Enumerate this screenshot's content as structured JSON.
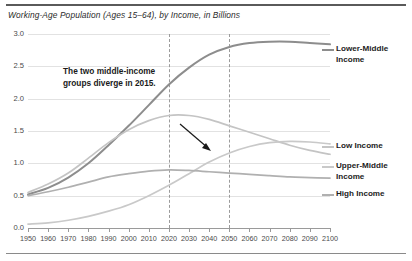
{
  "chart_data": {
    "type": "line",
    "title": "Working-Age Population (Ages 15–64), by Income, in Billions",
    "xlabel": "",
    "ylabel": "",
    "xlim": [
      1950,
      2100
    ],
    "ylim": [
      0.0,
      3.0
    ],
    "grid": true,
    "legend_position": "right",
    "yticks": [
      "0.0",
      "0.5",
      "1.0",
      "1.5",
      "2.0",
      "2.5",
      "3.0"
    ],
    "ytick_values": [
      0.0,
      0.5,
      1.0,
      1.5,
      2.0,
      2.5,
      3.0
    ],
    "xticks": [
      "1950",
      "1960",
      "1970",
      "1980",
      "1990",
      "2000",
      "2010",
      "2020",
      "2030",
      "2040",
      "2050",
      "2060",
      "2070",
      "2080",
      "2090",
      "2100"
    ],
    "xtick_values": [
      1950,
      1960,
      1970,
      1980,
      1990,
      2000,
      2010,
      2020,
      2030,
      2040,
      2050,
      2060,
      2070,
      2080,
      2090,
      2100
    ],
    "reference_lines": [
      {
        "name": "dashed-2020",
        "x": 2020,
        "style": "dashed"
      },
      {
        "name": "dashed-2050",
        "x": 2050,
        "style": "dashed"
      }
    ],
    "annotations": [
      {
        "name": "divergence-note",
        "text_line1": "The two middle-income",
        "text_line2": "groups diverge in 2015.",
        "points_to_year": 2015,
        "points_to_value": 1.62
      }
    ],
    "x": [
      1950,
      1960,
      1970,
      1980,
      1990,
      2000,
      2010,
      2020,
      2030,
      2040,
      2050,
      2060,
      2070,
      2080,
      2090,
      2100
    ],
    "series": [
      {
        "name": "Lower-Middle Income",
        "color": "#8d8d8d",
        "values": [
          0.52,
          0.62,
          0.78,
          1.0,
          1.28,
          1.58,
          1.9,
          2.22,
          2.48,
          2.68,
          2.8,
          2.86,
          2.88,
          2.88,
          2.86,
          2.84
        ]
      },
      {
        "name": "Low Income",
        "color": "#c4c4c4",
        "values": [
          0.55,
          0.68,
          0.85,
          1.08,
          1.32,
          1.52,
          1.66,
          1.74,
          1.74,
          1.68,
          1.58,
          1.48,
          1.38,
          1.28,
          1.2,
          1.14
        ]
      },
      {
        "name": "Upper-Middle Income",
        "color": "#c9c9c9",
        "values": [
          0.06,
          0.08,
          0.12,
          0.18,
          0.26,
          0.36,
          0.5,
          0.66,
          0.84,
          1.02,
          1.16,
          1.26,
          1.32,
          1.34,
          1.33,
          1.3
        ]
      },
      {
        "name": "High Income",
        "color": "#b0b0b0",
        "values": [
          0.5,
          0.56,
          0.63,
          0.71,
          0.79,
          0.84,
          0.88,
          0.9,
          0.89,
          0.87,
          0.85,
          0.83,
          0.81,
          0.79,
          0.78,
          0.77
        ]
      }
    ]
  },
  "legend": {
    "entries": [
      {
        "label_line1": "Lower-Middle",
        "label_line2": "Income",
        "color": "#8d8d8d"
      },
      {
        "label_line1": "Low Income",
        "label_line2": "",
        "color": "#c4c4c4"
      },
      {
        "label_line1": "Upper-Middle",
        "label_line2": "Income",
        "color": "#c9c9c9"
      },
      {
        "label_line1": "High Income",
        "label_line2": "",
        "color": "#b0b0b0"
      }
    ]
  }
}
